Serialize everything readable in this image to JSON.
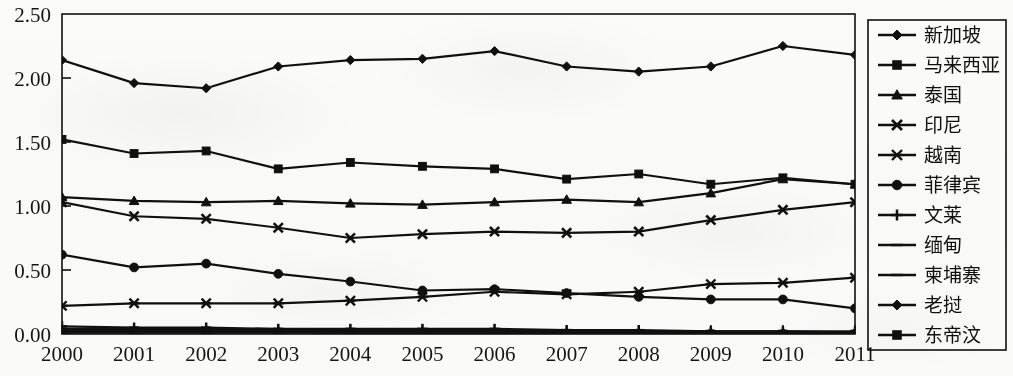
{
  "chart_data": {
    "type": "line",
    "title": "",
    "subtitle": "",
    "xlabel": "",
    "ylabel": "",
    "x": [
      2000,
      2001,
      2002,
      2003,
      2004,
      2005,
      2006,
      2007,
      2008,
      2009,
      2010,
      2011
    ],
    "xtick_labels": [
      "2000",
      "2001",
      "2002",
      "2003",
      "2004",
      "2005",
      "2006",
      "2007",
      "2008",
      "2009",
      "2010",
      "2011"
    ],
    "ytick_labels": [
      "0.00",
      "0.50",
      "1.00",
      "1.50",
      "2.00",
      "2.50"
    ],
    "ytick_values": [
      0.0,
      0.5,
      1.0,
      1.5,
      2.0,
      2.5
    ],
    "ylim": [
      0.0,
      2.5
    ],
    "xlim": [
      2000,
      2011
    ],
    "grid": false,
    "legend_position": "right",
    "line_color": "#101010",
    "series": [
      {
        "name": "新加坡",
        "marker": "diamond",
        "values": [
          2.14,
          1.96,
          1.92,
          2.09,
          2.14,
          2.15,
          2.21,
          2.09,
          2.05,
          2.09,
          2.25,
          2.18
        ]
      },
      {
        "name": "马来西亚",
        "marker": "square",
        "values": [
          1.52,
          1.41,
          1.43,
          1.29,
          1.34,
          1.31,
          1.29,
          1.21,
          1.25,
          1.17,
          1.22,
          1.17
        ]
      },
      {
        "name": "泰国",
        "marker": "triangle",
        "values": [
          1.07,
          1.04,
          1.03,
          1.04,
          1.02,
          1.01,
          1.03,
          1.05,
          1.03,
          1.1,
          1.21,
          1.17
        ]
      },
      {
        "name": "印尼",
        "marker": "x",
        "values": [
          1.03,
          0.92,
          0.9,
          0.83,
          0.75,
          0.78,
          0.8,
          0.79,
          0.8,
          0.89,
          0.97,
          1.03
        ]
      },
      {
        "name": "越南",
        "marker": "asterisk",
        "values": [
          0.22,
          0.24,
          0.24,
          0.24,
          0.26,
          0.29,
          0.33,
          0.31,
          0.33,
          0.39,
          0.4,
          0.44
        ]
      },
      {
        "name": "菲律宾",
        "marker": "circle",
        "values": [
          0.62,
          0.52,
          0.55,
          0.47,
          0.41,
          0.34,
          0.35,
          0.32,
          0.29,
          0.27,
          0.27,
          0.2
        ]
      },
      {
        "name": "文莱",
        "marker": "plus",
        "values": [
          0.06,
          0.05,
          0.05,
          0.04,
          0.04,
          0.04,
          0.04,
          0.03,
          0.03,
          0.02,
          0.02,
          0.02
        ]
      },
      {
        "name": "缅甸",
        "marker": "dash",
        "values": [
          0.04,
          0.04,
          0.04,
          0.03,
          0.03,
          0.03,
          0.03,
          0.03,
          0.02,
          0.02,
          0.02,
          0.01
        ]
      },
      {
        "name": "柬埔寨",
        "marker": "dash",
        "values": [
          0.03,
          0.03,
          0.03,
          0.03,
          0.02,
          0.02,
          0.02,
          0.02,
          0.02,
          0.01,
          0.01,
          0.01
        ]
      },
      {
        "name": "老挝",
        "marker": "diamond",
        "values": [
          0.02,
          0.02,
          0.02,
          0.02,
          0.01,
          0.01,
          0.01,
          0.01,
          0.01,
          0.01,
          0.01,
          0.01
        ]
      },
      {
        "name": "东帝汶",
        "marker": "square",
        "values": [
          0.01,
          0.01,
          0.01,
          0.01,
          0.01,
          0.01,
          0.01,
          0.0,
          0.0,
          0.0,
          0.0,
          0.0
        ]
      }
    ]
  },
  "legend": {
    "items": [
      {
        "label": "新加坡"
      },
      {
        "label": "马来西亚"
      },
      {
        "label": "泰国"
      },
      {
        "label": "印尼"
      },
      {
        "label": "越南"
      },
      {
        "label": "菲律宾"
      },
      {
        "label": "文莱"
      },
      {
        "label": "缅甸"
      },
      {
        "label": "柬埔寨"
      },
      {
        "label": "老挝"
      },
      {
        "label": "东帝汶"
      }
    ]
  }
}
